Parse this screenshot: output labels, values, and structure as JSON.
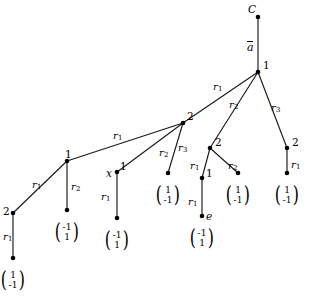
{
  "diagram": {
    "type": "labeled-tree",
    "title_node": "C",
    "root_edge_label": "ā",
    "nodes": [
      {
        "id": "C",
        "label": "C",
        "label_style": "italic",
        "x": 258,
        "y": 17,
        "label_dx": -10,
        "label_dy": -13
      },
      {
        "id": "root",
        "label": "1",
        "label_style": "upright",
        "x": 258,
        "y": 72,
        "label_dx": 5,
        "label_dy": -12
      },
      {
        "id": "n2a",
        "label": "2",
        "label_style": "upright",
        "x": 183,
        "y": 123,
        "label_dx": 4,
        "label_dy": -12
      },
      {
        "id": "n2b",
        "label": "2",
        "label_style": "upright",
        "x": 210,
        "y": 148,
        "label_dx": 5,
        "label_dy": -11
      },
      {
        "id": "n2c",
        "label": "2",
        "label_style": "upright",
        "x": 287,
        "y": 148,
        "label_dx": 5,
        "label_dy": -11
      },
      {
        "id": "n1a",
        "label": "1",
        "label_style": "upright",
        "x": 67,
        "y": 161,
        "label_dx": -2,
        "label_dy": -12
      },
      {
        "id": "nx",
        "label": "1",
        "label_style": "upright",
        "x": 117,
        "y": 172,
        "label_dx": 3,
        "label_dy": -11
      },
      {
        "id": "n1b",
        "label": "1",
        "label_style": "upright",
        "x": 202,
        "y": 178,
        "label_dx": 4,
        "label_dy": -10
      },
      {
        "id": "n2d",
        "label": "2",
        "label_style": "upright",
        "x": 13,
        "y": 213,
        "label_dx": -10,
        "label_dy": -7
      },
      {
        "id": "ne",
        "label": "e",
        "label_style": "italic",
        "x": 202,
        "y": 216,
        "label_dx": 4,
        "label_dy": -5
      },
      {
        "id": "lf1",
        "label": "",
        "label_style": "upright",
        "x": 67,
        "y": 210,
        "label_dx": 0,
        "label_dy": 0
      },
      {
        "id": "lf2",
        "label": "",
        "label_style": "upright",
        "x": 117,
        "y": 218,
        "label_dx": 0,
        "label_dy": 0
      },
      {
        "id": "lf3",
        "label": "",
        "label_style": "upright",
        "x": 168,
        "y": 173,
        "label_dx": 0,
        "label_dy": 0
      },
      {
        "id": "lf4",
        "label": "",
        "label_style": "upright",
        "x": 238,
        "y": 173,
        "label_dx": 0,
        "label_dy": 0
      },
      {
        "id": "lf5",
        "label": "",
        "label_style": "upright",
        "x": 287,
        "y": 173,
        "label_dx": 0,
        "label_dy": 0
      },
      {
        "id": "lf6",
        "label": "",
        "label_style": "upright",
        "x": 13,
        "y": 258,
        "label_dx": 0,
        "label_dy": 0
      }
    ],
    "node_x_marker": {
      "label": "x",
      "x": 106,
      "y": 168
    },
    "edges": [
      {
        "id": "e-C-root",
        "from": "C",
        "to": "root",
        "label": "ā",
        "is_abar": true,
        "label_x": 247,
        "label_y": 42
      },
      {
        "id": "e-root-n2a",
        "from": "root",
        "to": "n2a",
        "label": "r",
        "sub": "1",
        "label_x": 213,
        "label_y": 82
      },
      {
        "id": "e-root-n2b",
        "from": "root",
        "to": "n2b",
        "label": "r",
        "sub": "2",
        "label_x": 229,
        "label_y": 100
      },
      {
        "id": "e-root-n2c",
        "from": "root",
        "to": "n2c",
        "label": "r",
        "sub": "3",
        "label_x": 271,
        "label_y": 103
      },
      {
        "id": "e-n2a-n1a",
        "from": "n2a",
        "to": "n1a",
        "label": "r",
        "sub": "1",
        "label_x": 113,
        "label_y": 131
      },
      {
        "id": "e-n2a-nx",
        "from": "n2a",
        "to": "nx",
        "label": "r",
        "sub": "2",
        "label_x": 159,
        "label_y": 148
      },
      {
        "id": "e-n2a-lf3",
        "from": "n2a",
        "to": "lf3",
        "label": "r",
        "sub": "3",
        "label_x": 178,
        "label_y": 143
      },
      {
        "id": "e-n1a-n2d",
        "from": "n1a",
        "to": "n2d",
        "label": "r",
        "sub": "1",
        "label_x": 32,
        "label_y": 180
      },
      {
        "id": "e-n1a-lf1",
        "from": "n1a",
        "to": "lf1",
        "label": "r",
        "sub": "2",
        "label_x": 71,
        "label_y": 182
      },
      {
        "id": "e-nx-lf2",
        "from": "nx",
        "to": "lf2",
        "label": "r",
        "sub": "1",
        "label_x": 101,
        "label_y": 192
      },
      {
        "id": "e-n2b-n1b",
        "from": "n2b",
        "to": "n1b",
        "label": "r",
        "sub": "1",
        "label_x": 190,
        "label_y": 161
      },
      {
        "id": "e-n2b-lf4",
        "from": "n2b",
        "to": "lf4",
        "label": "r",
        "sub": "2",
        "label_x": 228,
        "label_y": 161
      },
      {
        "id": "e-n1b-ne",
        "from": "n1b",
        "to": "ne",
        "label": "r",
        "sub": "1",
        "label_x": 188,
        "label_y": 197
      },
      {
        "id": "e-n2c-lf5",
        "from": "n2c",
        "to": "lf5",
        "label": "r",
        "sub": "1",
        "label_x": 291,
        "label_y": 160
      },
      {
        "id": "e-n2d-lf6",
        "from": "n2d",
        "to": "lf6",
        "label": "r",
        "sub": "1",
        "label_x": 3,
        "label_y": 232
      }
    ],
    "leaf_vectors": [
      {
        "id": "v-lf6",
        "top": "1",
        "bottom": "-1",
        "x": 13,
        "y": 281
      },
      {
        "id": "v-lf1",
        "top": "-1",
        "bottom": "1",
        "x": 67,
        "y": 233
      },
      {
        "id": "v-lf2",
        "top": "-1",
        "bottom": "1",
        "x": 117,
        "y": 241
      },
      {
        "id": "v-lf3",
        "top": "1",
        "bottom": "-1",
        "x": 168,
        "y": 196
      },
      {
        "id": "v-ne",
        "top": "-1",
        "bottom": "1",
        "x": 202,
        "y": 239
      },
      {
        "id": "v-lf4",
        "top": "1",
        "bottom": "-1",
        "x": 238,
        "y": 196
      },
      {
        "id": "v-lf5",
        "top": "1",
        "bottom": "-1",
        "x": 287,
        "y": 196
      }
    ],
    "colors": {
      "line": "#1a1a1a",
      "node": "#000000",
      "text": "#000000",
      "background": "#ffffff"
    }
  }
}
